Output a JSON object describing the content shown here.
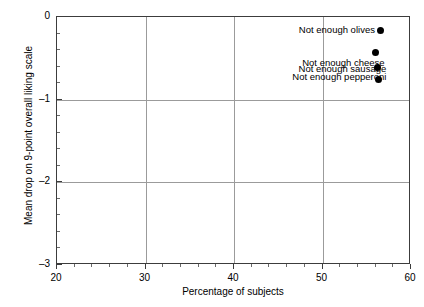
{
  "figure": {
    "cropped_title_fragment": "",
    "background_color": "#ffffff",
    "frame_color": "#3c3c3c",
    "grid_color": "#9b9b9b",
    "marker_color": "#000000"
  },
  "chart_data": {
    "type": "scatter",
    "title": "",
    "xlabel": "Percentage of subjects",
    "ylabel": "Mean drop on 9-point overall liking scale",
    "xlim": [
      20,
      60
    ],
    "ylim": [
      0,
      -3
    ],
    "y_axis_inverted": true,
    "grid": true,
    "grid_axes": "both-major",
    "legend": "none",
    "x_ticks": [
      20,
      30,
      40,
      50,
      60
    ],
    "x_ticklabels": [
      "20",
      "30",
      "40",
      "50",
      "60"
    ],
    "x_minor_tick_step": 2,
    "y_ticks": [
      0,
      -1,
      -2,
      -3
    ],
    "y_ticklabels": [
      "0",
      "–1",
      "–2",
      "–3"
    ],
    "y_minor_tick_step": 0.2,
    "points": [
      {
        "label": "Not enough sausage",
        "x": 56.3,
        "y": -0.75,
        "label_position": "above-left"
      },
      {
        "label": "Not enough pepperoni",
        "x": 56.2,
        "y": -0.61,
        "label_position": "below-left"
      },
      {
        "label": "Not enough cheese",
        "x": 56.0,
        "y": -0.43,
        "label_position": "below-left"
      },
      {
        "label": "Not enough olives",
        "x": 56.6,
        "y": -0.16,
        "label_position": "left"
      }
    ]
  }
}
